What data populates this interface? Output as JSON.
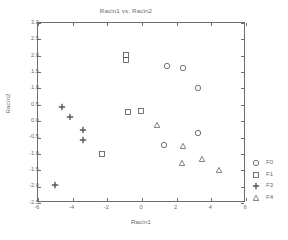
{
  "chart_data": {
    "type": "scatter",
    "title": "Racin1 vs. Racin2",
    "xlabel": "Racin1",
    "ylabel": "Racin2",
    "xlim": [
      -6,
      6
    ],
    "ylim": [
      -2.5,
      3.0
    ],
    "xticks": [
      -6,
      -4,
      -2,
      0,
      2,
      4,
      6
    ],
    "xticklabels": [
      "-6",
      "-4",
      "-2",
      "0",
      "2",
      "4",
      "6"
    ],
    "yticks": [
      -2.5,
      -2.0,
      -1.5,
      -1.0,
      -0.5,
      0.0,
      0.5,
      1.0,
      1.5,
      2.0,
      2.5,
      3.0
    ],
    "yticklabels": [
      "-2.5",
      "-2.0",
      "-1.5",
      "-1.0",
      "-0.5",
      "0.0",
      "0.5",
      "1.0",
      "1.5",
      "2.0",
      "2.5",
      "3.0"
    ],
    "grid": false,
    "legend_position": "right",
    "series": [
      {
        "name": "F0",
        "marker": "circle",
        "color": "#58585a",
        "points": [
          {
            "x": 1.45,
            "y": 1.7
          },
          {
            "x": 2.35,
            "y": 1.62
          },
          {
            "x": 3.25,
            "y": 1.02
          },
          {
            "x": 1.25,
            "y": -0.72
          },
          {
            "x": 3.25,
            "y": -0.36
          }
        ]
      },
      {
        "name": "F1",
        "marker": "square",
        "color": "#58585a",
        "points": [
          {
            "x": -0.9,
            "y": 2.02
          },
          {
            "x": -0.9,
            "y": 1.88
          },
          {
            "x": -0.78,
            "y": 0.28
          },
          {
            "x": -0.05,
            "y": 0.3
          },
          {
            "x": -2.3,
            "y": -1.0
          }
        ]
      },
      {
        "name": "F3",
        "marker": "plus",
        "color": "#58585a",
        "points": [
          {
            "x": -4.62,
            "y": 0.43
          },
          {
            "x": -4.15,
            "y": 0.14
          },
          {
            "x": -3.42,
            "y": -0.26
          },
          {
            "x": -3.4,
            "y": -0.58
          },
          {
            "x": -5.0,
            "y": -1.95
          }
        ]
      },
      {
        "name": "F4",
        "marker": "triangle",
        "color": "#58585a",
        "points": [
          {
            "x": 0.85,
            "y": -0.13
          },
          {
            "x": 2.35,
            "y": -0.77
          },
          {
            "x": 2.3,
            "y": -1.29
          },
          {
            "x": 3.45,
            "y": -1.16
          },
          {
            "x": 4.45,
            "y": -1.48
          }
        ]
      }
    ]
  },
  "legend": {
    "entries": [
      {
        "label": "F0",
        "marker": "circle"
      },
      {
        "label": "F1",
        "marker": "square"
      },
      {
        "label": "F3",
        "marker": "plus"
      },
      {
        "label": "F4",
        "marker": "triangle"
      }
    ]
  }
}
